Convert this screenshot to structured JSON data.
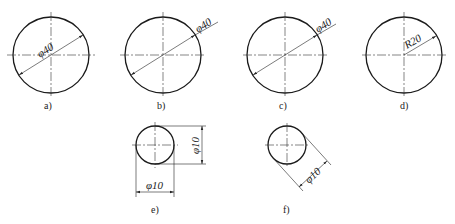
{
  "figure": {
    "views": [
      {
        "id": "a",
        "label": "a)",
        "dimension": "φ40",
        "type": "diameter-inside"
      },
      {
        "id": "b",
        "label": "b)",
        "dimension": "φ40",
        "type": "diameter-leader-outside"
      },
      {
        "id": "c",
        "label": "c)",
        "dimension": "φ40",
        "type": "diameter-leader-outside"
      },
      {
        "id": "d",
        "label": "d)",
        "dimension": "R20",
        "type": "radius"
      },
      {
        "id": "e",
        "label": "e)",
        "dimension_h": "φ10",
        "dimension_v": "φ10",
        "type": "small-diameter-linear"
      },
      {
        "id": "f",
        "label": "f)",
        "dimension": "φ10",
        "type": "small-diameter-aligned"
      }
    ]
  }
}
